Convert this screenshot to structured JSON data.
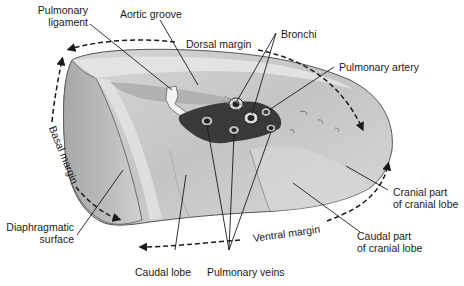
{
  "figure": {
    "labels": {
      "pulmonary_ligament": "Pulmonary ligament",
      "pulmonary_ligament_line1": "Pulmonary",
      "pulmonary_ligament_line2": "ligament",
      "aortic_groove": "Aortic groove",
      "dorsal_margin": "Dorsal margin",
      "bronchi": "Bronchi",
      "pulmonary_artery": "Pulmonary artery",
      "basal_margin": "Basal margin",
      "cranial_part_line1": "Cranial part",
      "cranial_part_line2": "of cranial lobe",
      "diaphragmatic_line1": "Diaphragmatic",
      "diaphragmatic_line2": "surface",
      "ventral_margin": "Ventral margin",
      "caudal_part_line1": "Caudal part",
      "caudal_part_line2": "of cranial lobe",
      "caudal_lobe": "Caudal lobe",
      "pulmonary_veins": "Pulmonary veins"
    },
    "colors": {
      "lung_fill": "#c9c9c9",
      "lung_light": "#e2e2e2",
      "lung_dark": "#8e8e8e",
      "hilum_dark": "#2e2e2e",
      "leader_line": "#1a1a1a",
      "text": "#1a1a1a"
    }
  }
}
